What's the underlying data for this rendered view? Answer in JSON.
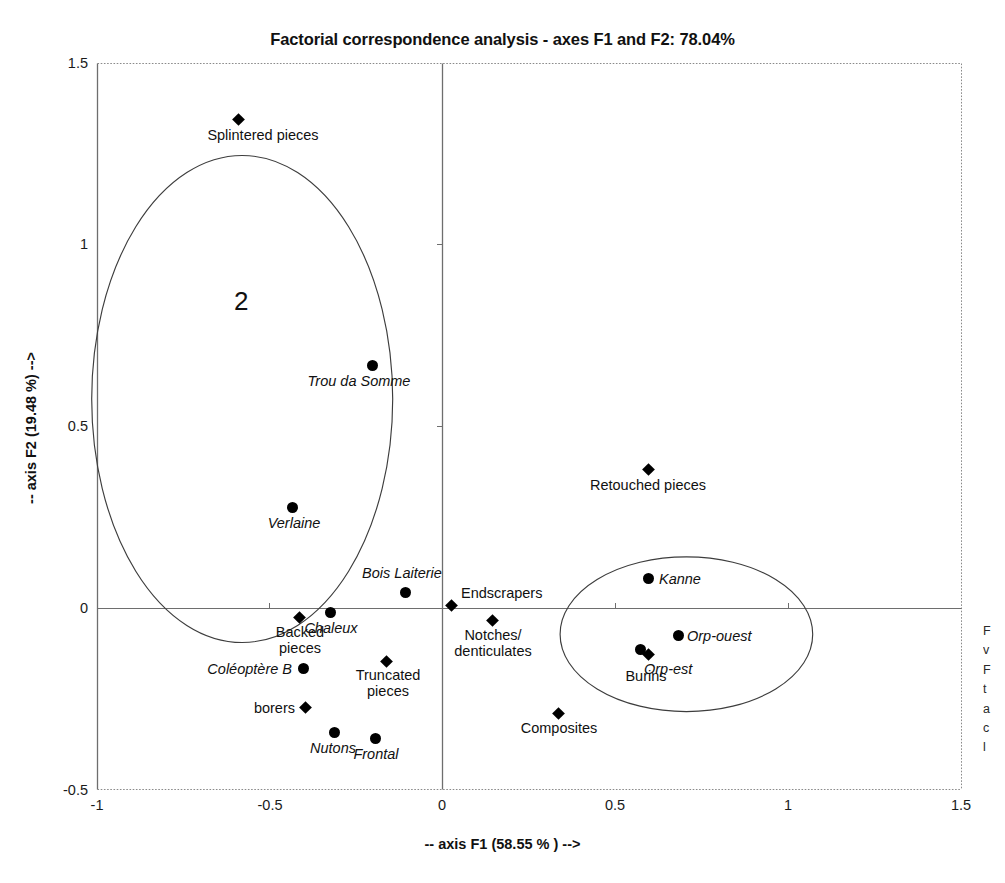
{
  "chart_data": {
    "type": "scatter",
    "title": "Factorial correspondence analysis - axes F1 and F2: 78.04%",
    "xlabel": "-- axis F1 (58.55 % ) -->",
    "ylabel": "-- axis F2 (19.48 %) -->",
    "xlim": [
      -1,
      1.5
    ],
    "ylim": [
      -0.5,
      1.5
    ],
    "xticks": [
      "-1",
      "-0.5",
      "0",
      "0.5",
      "1",
      "1.5"
    ],
    "xtick_values": [
      -1,
      -0.5,
      0,
      0.5,
      1,
      1.5
    ],
    "yticks": [
      "1.5",
      "1",
      "0.5",
      "0",
      "-0.5"
    ],
    "ytick_values": [
      1.5,
      1,
      0.5,
      0,
      -0.5
    ],
    "grid": false,
    "legend": "none",
    "series": [
      {
        "name": "Tool types",
        "marker": "diamond",
        "label_style": "roman",
        "points": [
          {
            "label": "Splintered pieces",
            "x": -0.59,
            "y": 1.345,
            "label_pos": "below-center",
            "label_dx": 24,
            "label_dy": 14
          },
          {
            "label": "Retouched pieces",
            "x": 0.695,
            "y": 0.385,
            "label_pos": "below-center",
            "label_dx": 0,
            "label_dy": 14
          },
          {
            "label": "Endscrapers",
            "x": 0.025,
            "y": 0.008,
            "label_pos": "right-above",
            "label_dx": 13,
            "label_dy": -22
          },
          {
            "label": "Notches/\ndenticulates",
            "x": 0.145,
            "y": -0.032,
            "label_pos": "below-center",
            "label_dx": 0,
            "label_dy": 14
          },
          {
            "label": "Backed\npieces",
            "x": -0.415,
            "y": -0.025,
            "label_pos": "below-center",
            "label_dx": 0,
            "label_dy": 13
          },
          {
            "label": "Truncated\npieces",
            "x": -0.252,
            "y": -0.145,
            "label_pos": "below-center",
            "label_dx": 2,
            "label_dy": 13
          },
          {
            "label": "borers",
            "x": -0.395,
            "y": -0.272,
            "label_pos": "left",
            "label_dx": -12,
            "label_dy": -9
          },
          {
            "label": "Burins",
            "x": 0.595,
            "y": -0.128,
            "label_pos": "below-center",
            "label_dx": -2,
            "label_dy": 14
          },
          {
            "label": "Composites",
            "x": 0.335,
            "y": -0.288,
            "label_pos": "below-center",
            "label_dx": 0,
            "label_dy": 14
          }
        ]
      },
      {
        "name": "Sites",
        "marker": "circle",
        "label_style": "italic",
        "points": [
          {
            "label": "Trou da Somme",
            "x": -0.202,
            "y": 0.675,
            "label_pos": "below-center",
            "label_dx": -14,
            "label_dy": 14
          },
          {
            "label": "Verlaine",
            "x": -0.435,
            "y": 0.278,
            "label_pos": "below-center",
            "label_dx": 1,
            "label_dy": 14
          },
          {
            "label": "Bois Laiterie",
            "x": -0.108,
            "y": 0.043,
            "label_pos": "above-center",
            "label_dx": -4,
            "label_dy": -21
          },
          {
            "label": "Chaleux",
            "x": -0.325,
            "y": -0.012,
            "label_pos": "below-center",
            "label_dx": 0,
            "label_dy": 15
          },
          {
            "label": "Coléoptère B",
            "x": -0.402,
            "y": -0.165,
            "label_pos": "left",
            "label_dx": -13,
            "label_dy": -9
          },
          {
            "label": "Nutons",
            "x": -0.312,
            "y": -0.342,
            "label_pos": "below-center",
            "label_dx": -2,
            "label_dy": 15
          },
          {
            "label": "Frontal",
            "x": -0.195,
            "y": -0.358,
            "label_pos": "below-center",
            "label_dx": 1,
            "label_dy": 15
          },
          {
            "label": "Kanne",
            "x": 0.695,
            "y": 0.082,
            "label_pos": "right",
            "label_dx": 10,
            "label_dy": -9
          },
          {
            "label": "Orp-ouest",
            "x": 0.782,
            "y": -0.075,
            "label_pos": "right",
            "label_dx": 9,
            "label_dy": -9
          },
          {
            "label": "Orp-est",
            "x": 0.672,
            "y": -0.112,
            "label_pos": "below-right",
            "label_dx": 4,
            "label_dy": 13
          }
        ]
      }
    ],
    "annotations": [
      {
        "text": "2",
        "type": "cluster-number",
        "x": -0.555,
        "y": 0.905
      }
    ],
    "ellipses": [
      {
        "name": "cluster-2-ellipse",
        "cx": -0.58,
        "cy": 0.575,
        "rx": 0.435,
        "ry": 0.67
      },
      {
        "name": "cluster-right-ellipse",
        "cx": 0.705,
        "cy": -0.072,
        "rx": 0.365,
        "ry": 0.213
      }
    ]
  },
  "margin_caption": {
    "lines": [
      "F",
      "v",
      "F",
      "t",
      "a",
      "c",
      "l"
    ]
  }
}
